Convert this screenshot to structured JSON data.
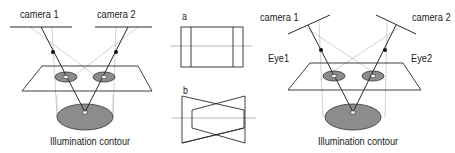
{
  "diagrams": {
    "left": {
      "camera1_label": "camera 1",
      "camera2_label": "camera 2",
      "contour_label": "Illumination contour"
    },
    "middle": {
      "panel_a_label": "a",
      "panel_b_label": "b"
    },
    "right": {
      "camera1_label": "camera 1",
      "camera2_label": "camera 2",
      "eye1_label": "Eye1",
      "eye2_label": "Eye2",
      "contour_label": "Illumination contour"
    }
  },
  "colors": {
    "line": "#2a2a2a",
    "ray_light": "#b8b8b8",
    "ellipse_fill": "#8c8c8c",
    "background": "#ffffff"
  }
}
